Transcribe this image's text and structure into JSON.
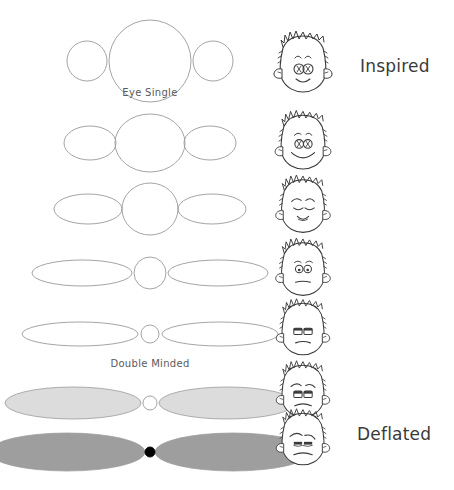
{
  "figure": {
    "background_color": "#ffffff",
    "stroke_color": "#8c8c8c",
    "dark_stroke_color": "#3a3a3a",
    "caption_color": "#5a5a5a",
    "label_color": "#3a3a3a"
  },
  "captions": {
    "top": "Eye Single",
    "bottom": "Double Minded"
  },
  "labels": {
    "top": "Inspired",
    "bottom": "Deflated"
  },
  "chart_data": {
    "type": "diagram",
    "axis_top_label": "Eye Single",
    "axis_bottom_label": "Double Minded",
    "state_top_label": "Inspired",
    "state_bottom_label": "Deflated",
    "rows": [
      {
        "index": 1,
        "center_rx": 41,
        "center_ry": 41,
        "side_rx": 20,
        "side_ry": 20,
        "side_offset": 63,
        "fill": "none",
        "stroke": "#9a9a9a",
        "center_fill": "none",
        "cy": 61,
        "face": "inspired-wide-eyes"
      },
      {
        "index": 2,
        "center_rx": 35,
        "center_ry": 29,
        "side_rx": 26,
        "side_ry": 17,
        "side_offset": 60,
        "fill": "none",
        "stroke": "#9a9a9a",
        "center_fill": "none",
        "cy": 143,
        "face": "content-smile"
      },
      {
        "index": 3,
        "center_rx": 28,
        "center_ry": 26,
        "side_rx": 34,
        "side_ry": 15,
        "side_offset": 62,
        "fill": "none",
        "stroke": "#9a9a9a",
        "center_fill": "none",
        "cy": 209,
        "face": "calm-closed-eyes"
      },
      {
        "index": 4,
        "center_rx": 16,
        "center_ry": 16,
        "side_rx": 50,
        "side_ry": 13,
        "side_offset": 68,
        "fill": "none",
        "stroke": "#9a9a9a",
        "center_fill": "none",
        "cy": 273,
        "face": "worried-frown"
      },
      {
        "index": 5,
        "center_rx": 9,
        "center_ry": 9,
        "side_rx": 58,
        "side_ry": 12,
        "side_offset": 70,
        "fill": "none",
        "stroke": "#9a9a9a",
        "center_fill": "none",
        "cy": 334,
        "face": "flat-tired"
      },
      {
        "index": 6,
        "center_rx": 7,
        "center_ry": 7,
        "side_rx": 68,
        "side_ry": 16,
        "side_offset": 77,
        "fill": "#dcdcdc",
        "stroke": "#9a9a9a",
        "center_fill": "#ffffff",
        "cy": 403,
        "face": "droop-sad"
      },
      {
        "index": 7,
        "center_rx": 5,
        "center_ry": 5,
        "side_rx": 78,
        "side_ry": 19,
        "side_offset": 83,
        "fill": "#9e9e9e",
        "stroke": "#9e9e9e",
        "center_fill": "#000000",
        "cy": 452,
        "face": "deflated-flat"
      }
    ],
    "faces": [
      {
        "index": 1,
        "name": "inspired-wide-eyes",
        "cx": 303,
        "cy": 65,
        "scale": 1.0,
        "expression": "alert wide eyes, open mouth, spiky hair"
      },
      {
        "index": 2,
        "name": "content-smile",
        "cx": 303,
        "cy": 143,
        "scale": 0.96,
        "expression": "round eyes, broad smile"
      },
      {
        "index": 3,
        "name": "calm-closed-eyes",
        "cx": 303,
        "cy": 207,
        "scale": 0.94,
        "expression": "closed eyes, small smile"
      },
      {
        "index": 4,
        "name": "worried-frown",
        "cx": 303,
        "cy": 270,
        "scale": 0.94,
        "expression": "round eyes, straight worried mouth"
      },
      {
        "index": 5,
        "name": "flat-tired",
        "cx": 303,
        "cy": 330,
        "scale": 0.92,
        "expression": "half-lidded eyes, flat mouth"
      },
      {
        "index": 6,
        "name": "droop-sad",
        "cx": 303,
        "cy": 392,
        "scale": 0.92,
        "expression": "drooping brows, downturned mouth"
      },
      {
        "index": 7,
        "name": "deflated-flat",
        "cx": 303,
        "cy": 440,
        "scale": 0.92,
        "expression": "heavy lids, flat downturned mouth"
      }
    ]
  }
}
